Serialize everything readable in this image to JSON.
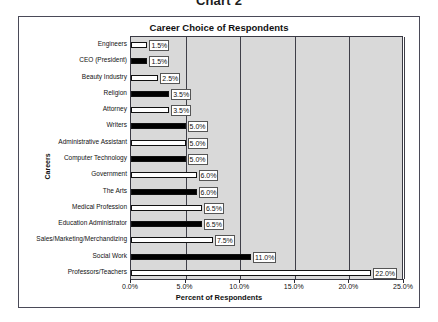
{
  "page": {
    "heading": "Chart 2"
  },
  "chart": {
    "title": "Career Choice of Respondents",
    "y_axis_title": "Careers",
    "x_axis_title": "Percent of Respondents"
  },
  "chart_data": {
    "type": "bar",
    "orientation": "horizontal",
    "title": "Career Choice of Respondents",
    "xlabel": "Percent of Respondents",
    "ylabel": "Careers",
    "xlim": [
      0,
      25
    ],
    "xticks": [
      0,
      5,
      10,
      15,
      20,
      25
    ],
    "xtick_labels": [
      "0.0%",
      "5.0%",
      "10.0%",
      "15.0%",
      "20.0%",
      "25.0%"
    ],
    "grid": true,
    "legend": false,
    "plot_bgcolor": "#d9d9d9",
    "categories": [
      "Engineers",
      "CEO (President)",
      "Beauty Industry",
      "Religion",
      "Attorney",
      "Writers",
      "Administrative Assistant",
      "Computer Technology",
      "Government",
      "The Arts",
      "Medical Profession",
      "Education Administrator",
      "Sales/Marketing/Merchandizing",
      "Social Work",
      "Professors/Teachers"
    ],
    "values": [
      1.5,
      1.5,
      2.5,
      3.5,
      3.5,
      5.0,
      5.0,
      5.0,
      6.0,
      6.0,
      6.5,
      6.5,
      7.5,
      11.0,
      22.0
    ],
    "data_labels": [
      "1.5%",
      "1.5%",
      "2.5%",
      "3.5%",
      "3.5%",
      "5.0%",
      "5.0%",
      "5.0%",
      "6.0%",
      "6.0%",
      "6.5%",
      "6.5%",
      "7.5%",
      "11.0%",
      "22.0%"
    ],
    "bar_fills": [
      "white",
      "black",
      "white",
      "black",
      "white",
      "black",
      "white",
      "black",
      "white",
      "black",
      "white",
      "black",
      "white",
      "black",
      "white"
    ]
  }
}
